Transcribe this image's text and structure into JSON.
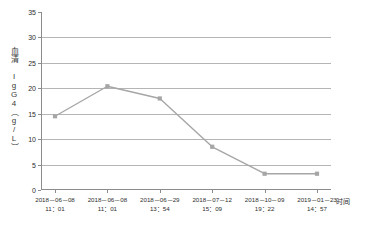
{
  "chart_data": {
    "type": "line",
    "title": "",
    "xlabel": "时间",
    "ylabel": "血清 IgG4（g/L）",
    "ylim": [
      0,
      35
    ],
    "yticks": [
      0,
      5,
      10,
      15,
      20,
      25,
      30,
      35
    ],
    "grid": true,
    "gridlines_at": [
      5,
      10,
      15,
      20,
      25,
      30
    ],
    "legend": "none",
    "series_color": "#a6a6a6",
    "marker": "square",
    "categories": [
      "2018-06-08 11:01",
      "2018-06-08 11:01",
      "2018-06-29 13:54",
      "2018-07-12 15:09",
      "2018-10-09 19:22",
      "2019-01-23 14:57"
    ],
    "category_lines": [
      {
        "date": "2018－06－08",
        "time": "11：01"
      },
      {
        "date": "2018－06－08",
        "time": "11：01"
      },
      {
        "date": "2018－06－29",
        "time": "13：54"
      },
      {
        "date": "2018－07－12",
        "time": "15：09"
      },
      {
        "date": "2018－10－09",
        "time": "19：22"
      },
      {
        "date": "2019－01－23",
        "time": "14：57"
      }
    ],
    "values": [
      14.5,
      20.4,
      18.0,
      8.5,
      3.2,
      3.2
    ]
  },
  "axes": {
    "y_title": "血清 IgG4（g/L）",
    "x_title": "时间",
    "y_tick_labels": [
      "0",
      "5",
      "10",
      "15",
      "20",
      "25",
      "30",
      "35"
    ]
  },
  "colors": {
    "line": "#a6a6a6",
    "marker": "#a6a6a6",
    "grid": "#b5b5b5",
    "axis": "#8c8c8c",
    "text": "#2e2e2e",
    "background": "#ffffff"
  }
}
